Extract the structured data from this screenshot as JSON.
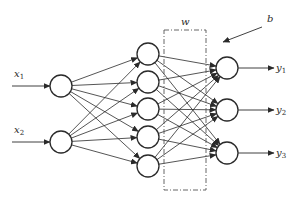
{
  "diagram": {
    "type": "neural-network",
    "inputs": [
      {
        "label": "x",
        "sub": "1",
        "x": 61,
        "y": 86
      },
      {
        "label": "x",
        "sub": "2",
        "x": 61,
        "y": 142
      }
    ],
    "hidden": [
      {
        "x": 148,
        "y": 54
      },
      {
        "x": 148,
        "y": 82
      },
      {
        "x": 148,
        "y": 109
      },
      {
        "x": 148,
        "y": 137
      },
      {
        "x": 148,
        "y": 166
      }
    ],
    "outputs": [
      {
        "label": "y",
        "sub": "1",
        "x": 227,
        "y": 68
      },
      {
        "label": "y",
        "sub": "2",
        "x": 227,
        "y": 110
      },
      {
        "label": "y",
        "sub": "3",
        "x": 227,
        "y": 153
      }
    ],
    "weight_label": "w",
    "bias_label": "b",
    "node_radius": 11,
    "colors": {
      "line": "#2a2a2a",
      "node_fill": "#ffffff"
    }
  }
}
